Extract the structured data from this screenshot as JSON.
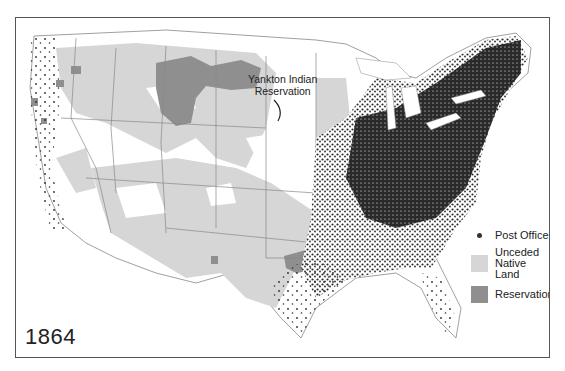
{
  "map": {
    "year_label": "1864",
    "annotation": {
      "line1": "Yankton Indian",
      "line2": "Reservation"
    },
    "legend": {
      "items": [
        {
          "label": "Post Office",
          "symbol": "dot",
          "color": "#333333"
        },
        {
          "label_line1": "Unceded",
          "label_line2": "Native Land",
          "symbol": "square",
          "color": "#d6d6d6"
        },
        {
          "label": "Reservation",
          "symbol": "square",
          "color": "#8f8f8f"
        }
      ]
    },
    "colors": {
      "background": "#ffffff",
      "state_border": "#777777",
      "unceded_land": "#d6d6d6",
      "reservation": "#8f8f8f",
      "post_office": "#2a2a2a",
      "frame": "#555555"
    }
  }
}
